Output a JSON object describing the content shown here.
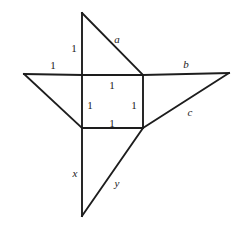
{
  "figure": {
    "background_color": "#ffffff",
    "stroke_color": "#1d1d1d",
    "label_color": "#1a1a1a",
    "stroke_width": 1.9,
    "width": 239,
    "height": 229
  },
  "geometry": {
    "square": {
      "name": "central-unit-square",
      "top_left": [
        82,
        75
      ],
      "top_right": [
        143,
        75
      ],
      "bottom_right": [
        143,
        128
      ],
      "bottom_left": [
        82,
        128
      ]
    },
    "top_triangle": {
      "name": "top-right-triangle",
      "apex": [
        82,
        13
      ],
      "vertices": [
        [
          82,
          13
        ],
        [
          82,
          75
        ],
        [
          143,
          75
        ]
      ],
      "hypotenuse_label": "a",
      "leg_label": "1"
    },
    "left_triangle": {
      "name": "left-right-triangle",
      "apex": [
        24,
        74
      ],
      "vertices": [
        [
          24,
          74
        ],
        [
          82,
          75
        ],
        [
          82,
          128
        ]
      ],
      "top_leg_label": "1"
    },
    "right_triangle": {
      "name": "right-right-triangle",
      "apex": [
        229,
        73
      ],
      "vertices": [
        [
          143,
          75
        ],
        [
          229,
          73
        ],
        [
          143,
          128
        ]
      ],
      "top_leg_label": "b",
      "hypotenuse_label": "c"
    },
    "bottom_triangle": {
      "name": "bottom-right-triangle",
      "apex": [
        82,
        216
      ],
      "vertices": [
        [
          82,
          128
        ],
        [
          82,
          216
        ],
        [
          143,
          128
        ]
      ],
      "vertical_leg_label": "x",
      "hypotenuse_label": "y"
    }
  },
  "labels": [
    {
      "id": "len-top-vertical",
      "text": "1",
      "style": "num",
      "x": 74,
      "y": 48,
      "describes": "vertical leg of top triangle"
    },
    {
      "id": "side-a",
      "text": "a",
      "style": "var",
      "x": 117,
      "y": 39,
      "describes": "hypotenuse of top triangle"
    },
    {
      "id": "len-left-top",
      "text": "1",
      "style": "num",
      "x": 53,
      "y": 65,
      "describes": "top leg of left triangle"
    },
    {
      "id": "side-b",
      "text": "b",
      "style": "var",
      "x": 186,
      "y": 64,
      "describes": "top leg of right triangle"
    },
    {
      "id": "len-square-top",
      "text": "1",
      "style": "num",
      "x": 112,
      "y": 85,
      "describes": "top side of square"
    },
    {
      "id": "len-square-left",
      "text": "1",
      "style": "num",
      "x": 90,
      "y": 105,
      "describes": "left side of square"
    },
    {
      "id": "len-square-right",
      "text": "1",
      "style": "num",
      "x": 134,
      "y": 105,
      "describes": "right side of square"
    },
    {
      "id": "side-c",
      "text": "c",
      "style": "var",
      "x": 190,
      "y": 112,
      "describes": "hypotenuse of right triangle"
    },
    {
      "id": "len-square-bottom",
      "text": "1",
      "style": "num",
      "x": 112,
      "y": 123,
      "describes": "bottom side of square"
    },
    {
      "id": "side-x",
      "text": "x",
      "style": "var",
      "x": 75,
      "y": 173,
      "describes": "vertical leg of bottom triangle"
    },
    {
      "id": "side-y",
      "text": "y",
      "style": "var",
      "x": 117,
      "y": 183,
      "describes": "hypotenuse of bottom triangle"
    }
  ],
  "segments": [
    {
      "id": "top-vertical",
      "name": "segment-top-vertical",
      "x1": 82,
      "y1": 13,
      "x2": 82,
      "y2": 75
    },
    {
      "id": "top-hypotenuse-a",
      "name": "segment-hypotenuse-a",
      "x1": 82,
      "y1": 13,
      "x2": 143,
      "y2": 75
    },
    {
      "id": "left-top-edge",
      "name": "segment-left-top-edge",
      "x1": 24,
      "y1": 74,
      "x2": 82,
      "y2": 75
    },
    {
      "id": "left-hypotenuse",
      "name": "segment-left-hypotenuse",
      "x1": 24,
      "y1": 74,
      "x2": 82,
      "y2": 128
    },
    {
      "id": "square-top",
      "name": "segment-square-top",
      "x1": 82,
      "y1": 75,
      "x2": 143,
      "y2": 75
    },
    {
      "id": "square-left",
      "name": "segment-square-left",
      "x1": 82,
      "y1": 75,
      "x2": 82,
      "y2": 128
    },
    {
      "id": "square-right",
      "name": "segment-square-right",
      "x1": 143,
      "y1": 75,
      "x2": 143,
      "y2": 128
    },
    {
      "id": "square-bottom",
      "name": "segment-square-bottom",
      "x1": 82,
      "y1": 128,
      "x2": 143,
      "y2": 128
    },
    {
      "id": "right-top-edge-b",
      "name": "segment-right-top-edge-b",
      "x1": 143,
      "y1": 75,
      "x2": 229,
      "y2": 73
    },
    {
      "id": "right-hypotenuse-c",
      "name": "segment-hypotenuse-c",
      "x1": 229,
      "y1": 73,
      "x2": 143,
      "y2": 128
    },
    {
      "id": "bottom-vertical-x",
      "name": "segment-bottom-vertical-x",
      "x1": 82,
      "y1": 128,
      "x2": 82,
      "y2": 216
    },
    {
      "id": "bottom-hypotenuse-y",
      "name": "segment-hypotenuse-y",
      "x1": 82,
      "y1": 216,
      "x2": 143,
      "y2": 128
    }
  ]
}
